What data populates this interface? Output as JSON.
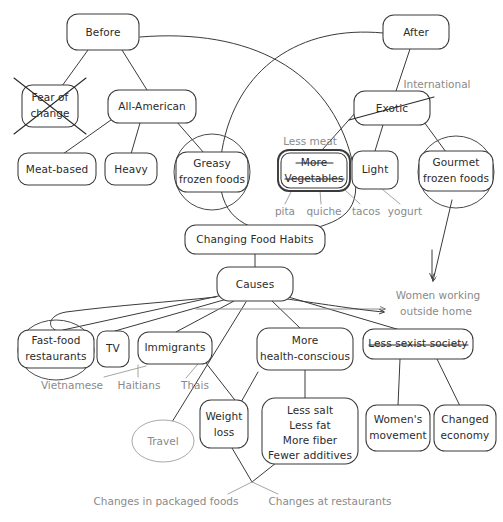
{
  "diagram": {
    "type": "hand-drawn concept map",
    "canvas": {
      "width": 503,
      "height": 522
    },
    "colors": {
      "ink": "#2b2b2b",
      "stroke": "#3a3a3a",
      "annotation": "#8a8a8a",
      "ghost": "#a9a9a9",
      "background": "#ffffff"
    }
  },
  "nodes": {
    "before": {
      "label": "Before",
      "x": 103,
      "y": 32,
      "w": 72,
      "h": 36,
      "struck": false,
      "circled": false,
      "emphasized": false
    },
    "fear_of_change": {
      "label_line1": "Fear of",
      "label_line2": "change",
      "x": 50,
      "y": 106,
      "w": 56,
      "h": 42,
      "struck": "x",
      "circled": false,
      "emphasized": false
    },
    "all_american": {
      "label": "All-American",
      "x": 152,
      "y": 106,
      "w": 88,
      "h": 34,
      "struck": false,
      "circled": false,
      "emphasized": false
    },
    "meat_based": {
      "label": "Meat-based",
      "x": 57,
      "y": 169,
      "w": 78,
      "h": 32,
      "struck": false,
      "circled": false,
      "emphasized": false
    },
    "heavy": {
      "label": "Heavy",
      "x": 131,
      "y": 169,
      "w": 52,
      "h": 32,
      "struck": false,
      "circled": false,
      "emphasized": false
    },
    "greasy_frozen_foods": {
      "label_line1": "Greasy",
      "label_line2": "frozen foods",
      "x": 212,
      "y": 171,
      "w": 72,
      "h": 40,
      "struck": false,
      "circled": true,
      "emphasized": false
    },
    "after": {
      "label": "After",
      "x": 416,
      "y": 32,
      "w": 66,
      "h": 34,
      "struck": false,
      "circled": false,
      "emphasized": false
    },
    "exotic": {
      "label": "Exotic",
      "x": 392,
      "y": 108,
      "w": 76,
      "h": 34,
      "struck": "diagonal",
      "circled": false,
      "emphasized": false
    },
    "more_vegetables": {
      "label_line1": "More",
      "label_line2": "Vegetables",
      "x": 314,
      "y": 170,
      "w": 72,
      "h": 40,
      "struck": "lines",
      "circled": false,
      "emphasized": true
    },
    "light": {
      "label": "Light",
      "x": 375,
      "y": 170,
      "w": 46,
      "h": 38,
      "struck": false,
      "circled": false,
      "emphasized": false
    },
    "gourmet_frozen_foods": {
      "label_line1": "Gourmet",
      "label_line2": "frozen foods",
      "x": 456,
      "y": 170,
      "w": 74,
      "h": 40,
      "struck": false,
      "circled": true,
      "emphasized": false
    },
    "changing_food_habits": {
      "label": "Changing Food Habits",
      "x": 255,
      "y": 239,
      "w": 140,
      "h": 30,
      "struck": false,
      "circled": false,
      "emphasized": false
    },
    "causes": {
      "label": "Causes",
      "x": 255,
      "y": 284,
      "w": 76,
      "h": 34,
      "struck": false,
      "circled": false,
      "emphasized": false
    },
    "fast_food_restaurants": {
      "label_line1": "Fast-food",
      "label_line2": "restaurants",
      "x": 55,
      "y": 348,
      "w": 74,
      "h": 38,
      "struck": false,
      "circled": true,
      "emphasized": false
    },
    "tv": {
      "label": "TV",
      "x": 112,
      "y": 348,
      "w": 32,
      "h": 34,
      "struck": false,
      "circled": false,
      "emphasized": false
    },
    "immigrants": {
      "label": "Immigrants",
      "x": 172,
      "y": 348,
      "w": 74,
      "h": 32,
      "struck": false,
      "circled": false,
      "emphasized": false
    },
    "more_health_conscious": {
      "label_line1": "More",
      "label_line2": "health-conscious",
      "x": 305,
      "y": 349,
      "w": 96,
      "h": 42,
      "struck": false,
      "circled": false,
      "emphasized": false
    },
    "less_sexist_society": {
      "label": "Less sexist society",
      "x": 417,
      "y": 344,
      "w": 108,
      "h": 30,
      "struck": "horizontal",
      "circled": false,
      "emphasized": false
    },
    "weight_loss": {
      "label_line1": "Weight",
      "label_line2": "loss",
      "x": 224,
      "y": 424,
      "w": 48,
      "h": 48,
      "struck": false,
      "circled": false,
      "emphasized": false
    },
    "health_details": {
      "label_line1": "Less salt",
      "label_line2": "Less fat",
      "label_line3": "More fiber",
      "label_line4": "Fewer additives",
      "x": 310,
      "y": 430,
      "w": 96,
      "h": 66,
      "struck": false,
      "circled": false,
      "emphasized": false
    },
    "womens_movement": {
      "label_line1": "Women's",
      "label_line2": "movement",
      "x": 398,
      "y": 428,
      "w": 64,
      "h": 46,
      "struck": false,
      "circled": false,
      "emphasized": false
    },
    "changed_economy": {
      "label_line1": "Changed",
      "label_line2": "economy",
      "x": 463,
      "y": 428,
      "w": 60,
      "h": 46,
      "struck": false,
      "circled": false,
      "emphasized": false
    },
    "travel": {
      "label": "Travel",
      "x": 163,
      "y": 441,
      "w": 62,
      "h": 40,
      "ghost": true
    }
  },
  "annotations": {
    "international": {
      "text": "International",
      "x": 437,
      "y": 85
    },
    "less_meat": {
      "text": "Less meat",
      "x": 310,
      "y": 142
    },
    "pita": {
      "text": "pita",
      "x": 287,
      "y": 212
    },
    "quiche": {
      "text": "quiche",
      "x": 323,
      "y": 212
    },
    "tacos": {
      "text": "tacos",
      "x": 364,
      "y": 212
    },
    "yogurt": {
      "text": "yogurt",
      "x": 404,
      "y": 212
    },
    "women_working_outside_home": {
      "line1": "Women working",
      "line2": "outside home",
      "x": 438,
      "y": 300
    },
    "vietnamese": {
      "text": "Vietnamese",
      "x": 72,
      "y": 386
    },
    "haitians": {
      "text": "Haitians",
      "x": 138,
      "y": 386
    },
    "thais": {
      "text": "Thais",
      "x": 194,
      "y": 386
    },
    "changes_in_packaged_foods": {
      "text": "Changes in packaged foods",
      "x": 166,
      "y": 502
    },
    "changes_at_restaurants": {
      "text": "Changes at restaurants",
      "x": 329,
      "y": 502
    }
  }
}
